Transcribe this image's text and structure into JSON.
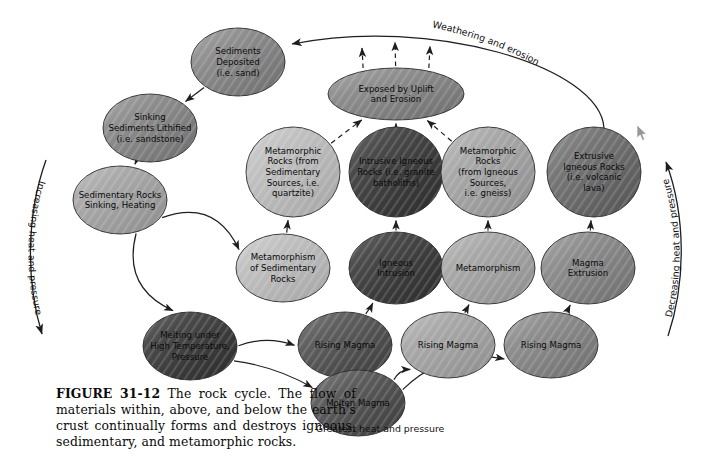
{
  "figure": {
    "caption_label": "FIGURE 31-12",
    "caption_text": "The rock cycle. The flow of materials within, above, and below the earth's crust continually forms and destroys igneous, sedimentary, and metamorphic rocks."
  },
  "colors": {
    "very_dark": "#3f3f3f",
    "dark": "#5b5b5b",
    "mid_dark": "#6e6e6e",
    "mid": "#848484",
    "light": "#a2a2a2",
    "very_light": "#b9b9b9",
    "stroke": "#2a2a2a",
    "line": "#1e1e1e",
    "text": "#0b0b0b"
  },
  "edge_labels": {
    "weathering": "Weathering and erosion",
    "increasing": "Increasing heat and pressure",
    "decreasing": "Decreasing heat and pressure",
    "greatest": "Greatest heat and pressure"
  },
  "nodes": [
    {
      "id": "sediments_deposited",
      "cx": 238,
      "cy": 62,
      "rx": 47,
      "ry": 34,
      "shade": "mid",
      "fontsize": 8.6,
      "lines": [
        "Sediments",
        "Deposited",
        "(i.e. sand)"
      ]
    },
    {
      "id": "sinking_lithified",
      "cx": 150,
      "cy": 128,
      "rx": 47,
      "ry": 34,
      "shade": "mid",
      "fontsize": 8.6,
      "lines": [
        "Sinking",
        "Sediments Lithified",
        "(i.e. sandstone)"
      ]
    },
    {
      "id": "sedimentary_sinking",
      "cx": 120,
      "cy": 200,
      "rx": 47,
      "ry": 34,
      "shade": "light",
      "fontsize": 8.6,
      "lines": [
        "Sedimentary Rocks",
        "Sinking, Heating"
      ]
    },
    {
      "id": "melting_under",
      "cx": 190,
      "cy": 346,
      "rx": 47,
      "ry": 34,
      "shade": "very_dark",
      "fontsize": 8.6,
      "lines": [
        "Melting under",
        "High Temperature,",
        "Pressure"
      ]
    },
    {
      "id": "metamorphism_sed",
      "cx": 283,
      "cy": 268,
      "rx": 47,
      "ry": 34,
      "shade": "very_light",
      "fontsize": 8.6,
      "lines": [
        "Metamorphism",
        "of Sedimentary",
        "Rocks"
      ]
    },
    {
      "id": "metamorphic_sed",
      "cx": 293,
      "cy": 172,
      "rx": 47,
      "ry": 45,
      "shade": "very_light",
      "fontsize": 8.6,
      "lines": [
        "Metamorphic",
        "Rocks (from",
        "Sedimentary",
        "Sources, i.e.",
        "quartzite)"
      ]
    },
    {
      "id": "exposed_uplift",
      "cx": 396,
      "cy": 94,
      "rx": 68,
      "ry": 26,
      "shade": "mid",
      "fontsize": 8.6,
      "lines": [
        "Exposed by Uplift",
        "and Erosion"
      ]
    },
    {
      "id": "intrusive_igneous",
      "cx": 396,
      "cy": 172,
      "rx": 47,
      "ry": 45,
      "shade": "very_dark",
      "fontsize": 8.6,
      "lines": [
        "Intrusive Igneous",
        "Rocks (i.e. granite",
        "batholiths)"
      ]
    },
    {
      "id": "metamorphic_ign",
      "cx": 488,
      "cy": 172,
      "rx": 47,
      "ry": 45,
      "shade": "light",
      "fontsize": 8.6,
      "lines": [
        "Metamorphic",
        "Rocks",
        "(from Igneous",
        "Sources,",
        "i.e. gneiss)"
      ]
    },
    {
      "id": "extrusive_igneous",
      "cx": 594,
      "cy": 172,
      "rx": 47,
      "ry": 45,
      "shade": "mid_dark",
      "fontsize": 8.6,
      "lines": [
        "Extrusive",
        "Igneous Rocks",
        "(i.e. volcanic",
        "lava)"
      ]
    },
    {
      "id": "igneous_intrusion",
      "cx": 396,
      "cy": 268,
      "rx": 47,
      "ry": 36,
      "shade": "very_dark",
      "fontsize": 8.6,
      "lines": [
        "Igneous",
        "Intrusion"
      ]
    },
    {
      "id": "metamorphism",
      "cx": 488,
      "cy": 268,
      "rx": 47,
      "ry": 36,
      "shade": "light",
      "fontsize": 8.6,
      "lines": [
        "Metamorphism"
      ]
    },
    {
      "id": "magma_extrusion",
      "cx": 588,
      "cy": 268,
      "rx": 47,
      "ry": 36,
      "shade": "mid",
      "fontsize": 8.6,
      "lines": [
        "Magma",
        "Extrusion"
      ]
    },
    {
      "id": "rising_magma_1",
      "cx": 345,
      "cy": 345,
      "rx": 47,
      "ry": 33,
      "shade": "dark",
      "fontsize": 8.6,
      "lines": [
        "Rising Magma"
      ]
    },
    {
      "id": "rising_magma_2",
      "cx": 448,
      "cy": 345,
      "rx": 47,
      "ry": 33,
      "shade": "light",
      "fontsize": 8.6,
      "lines": [
        "Rising Magma"
      ]
    },
    {
      "id": "rising_magma_3",
      "cx": 551,
      "cy": 345,
      "rx": 47,
      "ry": 33,
      "shade": "mid",
      "fontsize": 8.6,
      "lines": [
        "Rising Magma"
      ]
    },
    {
      "id": "molten_magma",
      "cx": 358,
      "cy": 403,
      "rx": 47,
      "ry": 33,
      "shade": "dark",
      "fontsize": 8.6,
      "lines": [
        "Molten Magma"
      ]
    }
  ],
  "edges": [
    {
      "id": "sediments-to-sinking",
      "from": "sediments_deposited",
      "to": "sinking_lithified"
    },
    {
      "id": "sinking-to-sedimentary",
      "from": "sinking_lithified",
      "to": "sedimentary_sinking"
    },
    {
      "id": "sedimentary-to-melting",
      "from": "sedimentary_sinking",
      "to": "melting_under"
    },
    {
      "id": "sedimentary-to-metamorphism",
      "from": "sedimentary_sinking",
      "to": "metamorphism_sed"
    },
    {
      "id": "metamorphism-to-metamorphic",
      "from": "metamorphism_sed",
      "to": "metamorphic_sed"
    },
    {
      "id": "melting-to-rising1",
      "from": "melting_under",
      "to": "rising_magma_1"
    },
    {
      "id": "melting-to-molten",
      "from": "melting_under",
      "to": "molten_magma"
    },
    {
      "id": "molten-to-rising2",
      "from": "molten_magma",
      "to": "rising_magma_2"
    },
    {
      "id": "molten-to-rising3",
      "from": "molten_magma",
      "to": "rising_magma_3"
    },
    {
      "id": "rising1-to-intrusion",
      "from": "rising_magma_1",
      "to": "igneous_intrusion"
    },
    {
      "id": "rising2-to-metamorphism",
      "from": "rising_magma_2",
      "to": "metamorphism"
    },
    {
      "id": "rising3-to-extrusion",
      "from": "rising_magma_3",
      "to": "magma_extrusion"
    },
    {
      "id": "intrusion-to-intrusive",
      "from": "igneous_intrusion",
      "to": "intrusive_igneous"
    },
    {
      "id": "metamorphism-to-metaign",
      "from": "metamorphism",
      "to": "metamorphic_ign"
    },
    {
      "id": "extrusion-to-extrusive",
      "from": "magma_extrusion",
      "to": "extrusive_igneous"
    },
    {
      "id": "metamorphic-sed-to-exposed",
      "from": "metamorphic_sed",
      "to": "exposed_uplift",
      "dashed": true
    },
    {
      "id": "intrusive-to-exposed",
      "from": "intrusive_igneous",
      "to": "exposed_uplift",
      "dashed": true
    },
    {
      "id": "metaign-to-exposed",
      "from": "metamorphic_ign",
      "to": "exposed_uplift",
      "dashed": true
    },
    {
      "id": "extrusive-to-sediments",
      "from": "extrusive_igneous",
      "to": "sediments_deposited"
    }
  ]
}
